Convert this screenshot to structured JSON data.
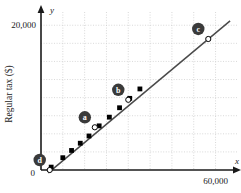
{
  "chart_data": {
    "type": "line",
    "title": "",
    "xlabel": "x",
    "ylabel": "Regular tax ($)",
    "yaxis_variable": "y",
    "xaxis_variable": "x",
    "origin_label": "0",
    "x_ticks": [
      {
        "value": 0,
        "label": "0"
      },
      {
        "value": 60000,
        "label": "60,000"
      }
    ],
    "y_ticks": [
      {
        "value": 0,
        "label": "0"
      },
      {
        "value": 20000,
        "label": "20,000"
      }
    ],
    "xlim": [
      0,
      66000
    ],
    "ylim": [
      0,
      21000
    ],
    "grid": true,
    "grid_style": "dotted",
    "grid_x_step": 7500,
    "grid_y_step": 2500,
    "legend": "none",
    "series": [
      {
        "name": "Regular tax line",
        "style": "line-with-square-markers",
        "marker": "filled-square",
        "x": [
          3500,
          7500,
          10500,
          13500,
          16500,
          20000,
          23500,
          27000,
          30500,
          34000
        ],
        "y": [
          400,
          1700,
          2700,
          3700,
          4700,
          6100,
          7300,
          8600,
          9900,
          11200
        ]
      }
    ],
    "annotated_points": [
      {
        "label": "d",
        "x": 3000,
        "y": 0,
        "marker": "open-circle"
      },
      {
        "label": "a",
        "x": 18500,
        "y": 5900,
        "marker": "open-circle"
      },
      {
        "label": "b",
        "x": 30000,
        "y": 9700,
        "marker": "open-circle"
      },
      {
        "label": "c",
        "x": 57500,
        "y": 18100,
        "marker": "open-circle"
      }
    ],
    "line_segment": {
      "x0": 2500,
      "y0": -400,
      "x1": 65000,
      "y1": 20600
    },
    "colors": {
      "line": "#4a4a4a",
      "marker": "#000000",
      "badge": "#3a3a3a",
      "badge_text": "#ffffff",
      "grid": "#cfcfcf",
      "axis": "#1a1a1a",
      "background": "#ffffff"
    }
  }
}
